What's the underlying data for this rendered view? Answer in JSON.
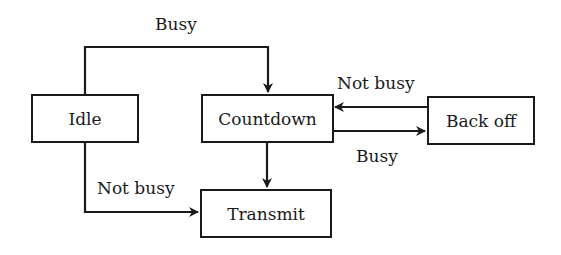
{
  "diagram": {
    "type": "state-diagram",
    "nodes": {
      "idle": "Idle",
      "countdown": "Countdown",
      "backoff": "Back off",
      "transmit": "Transmit"
    },
    "edges": [
      {
        "from": "Idle",
        "to": "Countdown",
        "label": "Busy"
      },
      {
        "from": "Idle",
        "to": "Transmit",
        "label": "Not busy"
      },
      {
        "from": "Countdown",
        "to": "Transmit",
        "label": ""
      },
      {
        "from": "Countdown",
        "to": "Back off",
        "label": "Busy"
      },
      {
        "from": "Back off",
        "to": "Countdown",
        "label": "Not busy"
      }
    ],
    "labels": {
      "idle_to_countdown": "Busy",
      "idle_to_transmit": "Not busy",
      "countdown_to_backoff": "Busy",
      "backoff_to_countdown": "Not busy"
    },
    "colors": {
      "stroke": "#1a1a1a",
      "background": "#ffffff"
    }
  }
}
